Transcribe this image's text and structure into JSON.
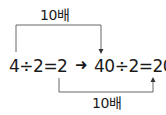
{
  "diagram": {
    "top_label": "10배",
    "bottom_label": "10배",
    "left_equation": "4÷2=2",
    "right_equation": "40÷2=20",
    "arrow_glyph": "➜",
    "line_color": "#555555",
    "text_color": "#1a1a1a"
  }
}
